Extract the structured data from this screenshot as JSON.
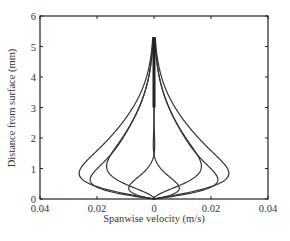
{
  "chart_data": {
    "type": "line",
    "title": "",
    "xlabel": "Spanwise velocity (m/s)",
    "ylabel": "Distance from surface (mm)",
    "xlim": [
      -0.04,
      0.04
    ],
    "ylim": [
      0,
      6
    ],
    "x_ticks": [
      -0.04,
      -0.02,
      0,
      0.02,
      0.04
    ],
    "x_tick_labels": [
      "0.04",
      "0.02",
      "0",
      "0.02",
      "0.04"
    ],
    "y_ticks": [
      0,
      1,
      2,
      3,
      4,
      5,
      6
    ],
    "y_tick_labels": [
      "0",
      "1",
      "2",
      "3",
      "4",
      "5",
      "6"
    ],
    "grid": false,
    "legend": null,
    "envelope": {
      "peak_velocity": 0.036,
      "peak_height_mm": 0.75,
      "convergence_height_mm": 4.0,
      "top_of_profiles_mm": 5.3
    },
    "series": [
      {
        "name": "phase 1",
        "amplitude": 0.036,
        "phase": 0.0
      },
      {
        "name": "phase 2",
        "amplitude": 0.036,
        "phase": 0.785
      },
      {
        "name": "phase 3",
        "amplitude": 0.036,
        "phase": 1.571
      },
      {
        "name": "phase 4",
        "amplitude": 0.036,
        "phase": 2.356
      },
      {
        "name": "phase 5",
        "amplitude": 0.036,
        "phase": 3.142
      },
      {
        "name": "phase 6",
        "amplitude": 0.036,
        "phase": 3.927
      },
      {
        "name": "phase 7",
        "amplitude": 0.036,
        "phase": 4.712
      },
      {
        "name": "phase 8",
        "amplitude": 0.036,
        "phase": 5.498
      }
    ],
    "stokes_params": {
      "delta_mm": 0.75,
      "y_max_mm": 5.3
    }
  }
}
